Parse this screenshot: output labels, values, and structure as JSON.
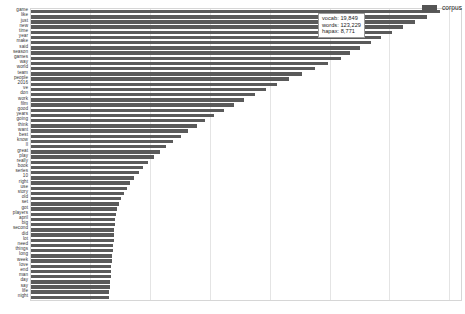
{
  "legend": {
    "swatch_color": "#555555",
    "entries": [
      {
        "label": "corpus",
        "color": "#555555"
      }
    ],
    "position": "top-right"
  },
  "tooltip": {
    "visible": true,
    "rows": [
      {
        "key": "vocab",
        "text": "vocab: 19,849"
      },
      {
        "key": "words",
        "text": "words: 123,229"
      },
      {
        "key": "hapax",
        "text": "hapax: 8,771"
      }
    ]
  },
  "axis": {
    "x_tick_labels": [],
    "y_tick_labels_shown": true,
    "gridlines": true
  },
  "chart_data": {
    "type": "bar",
    "orientation": "horizontal",
    "title": "",
    "subtitle": "",
    "xlabel": "",
    "ylabel": "",
    "grid": true,
    "legend_position": "top-right",
    "series": [
      {
        "name": "corpus",
        "color": "#5a5a5a",
        "values": [
          951,
          921,
          893,
          866,
          840,
          815,
          790,
          766,
          743,
          720,
          690,
          660,
          630,
          601,
          573,
          546,
          520,
          495,
          471,
          448,
          426,
          405,
          385,
          366,
          348,
          331,
          315,
          300,
          286,
          273,
          261,
          250,
          240,
          231,
          223,
          216,
          210,
          205,
          201,
          198,
          196,
          195,
          194,
          193,
          192,
          191,
          190,
          189,
          188,
          187,
          186,
          185,
          184,
          183,
          182,
          181
        ]
      }
    ],
    "categories": [
      "game",
      "like",
      "just",
      "new",
      "time",
      "year",
      "make",
      "said",
      "season",
      "games",
      "way",
      "world",
      "team",
      "people",
      "2016",
      "ve",
      "don",
      "work",
      "film",
      "good",
      "years",
      "going",
      "think",
      "want",
      "best",
      "know",
      "ll",
      "great",
      "play",
      "really",
      "book",
      "series",
      "10",
      "right",
      "use",
      "story",
      "old",
      "set",
      "got",
      "players",
      "april",
      "big",
      "second",
      "did",
      "lot",
      "need",
      "things",
      "long",
      "week",
      "love",
      "end",
      "man",
      "day",
      "say",
      "life",
      "night"
    ],
    "xlim": [
      0,
      1000
    ],
    "ylim": null,
    "gridline_fractions": [
      0.1378,
      0.2778,
      0.4167,
      0.5556,
      0.6944,
      0.8333,
      0.9722
    ]
  }
}
